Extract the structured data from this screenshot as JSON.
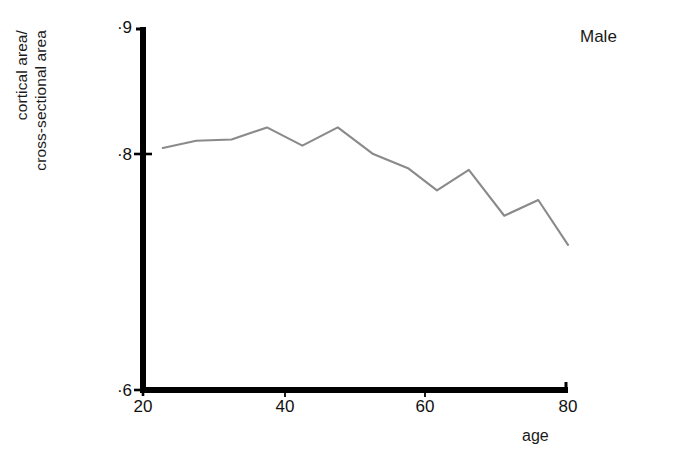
{
  "figure": {
    "background_color": "#ffffff",
    "axis_color": "#000000",
    "line_color": "#8a8a8a"
  },
  "annotation": {
    "series_label": "Male"
  },
  "chart_data": {
    "type": "line",
    "title": "",
    "subtitle": "",
    "xlabel": "age",
    "ylabel": "cortical area/\ncross-sectional area",
    "ylabel_lines": [
      "cortical area/",
      "cross-sectional area"
    ],
    "xlim": [
      20,
      80
    ],
    "ylim": [
      0.6,
      0.9
    ],
    "xticks": [
      20,
      40,
      60,
      80
    ],
    "xtick_labels": [
      "20",
      "40",
      "60",
      "80"
    ],
    "yticks": [
      0.6,
      0.8,
      0.9
    ],
    "ytick_labels": [
      "·6",
      "·8",
      "·9"
    ],
    "grid": false,
    "legend": "none",
    "series": [
      {
        "name": "Male",
        "color": "#8a8a8a",
        "x": [
          22.8,
          27.5,
          32.5,
          37.5,
          42.5,
          47.5,
          52.5,
          57.5,
          61.5,
          66.0,
          71.0,
          75.8,
          80.0
        ],
        "y": [
          0.8,
          0.806,
          0.807,
          0.817,
          0.802,
          0.817,
          0.795,
          0.783,
          0.765,
          0.782,
          0.744,
          0.757,
          0.72
        ]
      }
    ],
    "annotations": [
      {
        "text": "Male",
        "x": 76,
        "y": 0.888
      }
    ]
  }
}
